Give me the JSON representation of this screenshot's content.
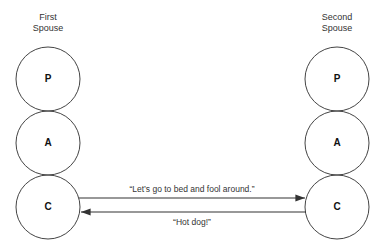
{
  "spouses": [
    {
      "title_line1": "First",
      "title_line2": "Spouse",
      "states": [
        "P",
        "A",
        "C"
      ]
    },
    {
      "title_line1": "Second",
      "title_line2": "Spouse",
      "states": [
        "P",
        "A",
        "C"
      ]
    }
  ],
  "transactions": [
    {
      "from": "First Spouse C",
      "to": "Second Spouse C",
      "text": "“Let’s go to bed and fool around.”"
    },
    {
      "from": "Second Spouse C",
      "to": "First Spouse C",
      "text": "“Hot dog!”"
    }
  ]
}
